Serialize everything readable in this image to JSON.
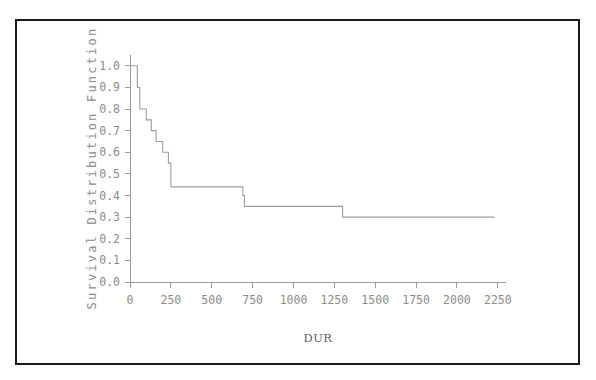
{
  "figure": {
    "background_color": "#ffffff",
    "border_color": "#1a1a1a",
    "curve_color": "#9d9d9d",
    "axis_color": "#9a9a9a",
    "label_color": "#8c8c8c"
  },
  "chart_data": {
    "type": "line",
    "title": "",
    "subtitle": "",
    "xlabel": "DUR",
    "ylabel": "Survival Distribution Function",
    "xlim": [
      0,
      2300
    ],
    "ylim": [
      0.0,
      1.05
    ],
    "grid": false,
    "legend": "none",
    "step": "post",
    "xticks": [
      0,
      250,
      500,
      750,
      1000,
      1250,
      1500,
      1750,
      2000,
      2250
    ],
    "xticklabels": [
      "0",
      "250",
      "500",
      "750",
      "1000",
      "1250",
      "1500",
      "1750",
      "2000",
      "2250"
    ],
    "yticks": [
      0.0,
      0.1,
      0.2,
      0.3,
      0.4,
      0.5,
      0.6,
      0.7,
      0.8,
      0.9,
      1.0
    ],
    "yticklabels": [
      "0.0",
      "0.1",
      "0.2",
      "0.3",
      "0.4",
      "0.5",
      "0.6",
      "0.7",
      "0.8",
      "0.9",
      "1.0"
    ],
    "series": [
      {
        "name": "Survival Distribution Function",
        "x": [
          0,
          20,
          45,
          60,
          80,
          100,
          130,
          160,
          200,
          215,
          235,
          250,
          640,
          660,
          690,
          700,
          1290,
          1300,
          2230
        ],
        "values": [
          1.0,
          1.0,
          0.9,
          0.8,
          0.8,
          0.75,
          0.7,
          0.65,
          0.6,
          0.6,
          0.55,
          0.44,
          0.44,
          0.44,
          0.4,
          0.35,
          0.35,
          0.3,
          0.3
        ]
      }
    ],
    "annotations": []
  },
  "axis": {
    "y_title": "Survival Distribution Function",
    "x_title": "DUR"
  }
}
